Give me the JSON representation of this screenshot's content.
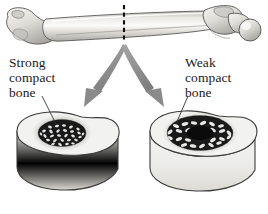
{
  "figure": {
    "background_color": "#ffffff"
  },
  "bone": {
    "name": "femur",
    "orientation": "horizontal",
    "fill_color": "#d8d6d0",
    "outline_color": "#4a4a4a",
    "section_marker": {
      "icon": "dashed-cut-line",
      "style": "dashed",
      "color": "#101010",
      "orientation": "vertical"
    }
  },
  "arrows": [
    {
      "id": "arrow-left",
      "direction": "down-left",
      "color": "#8e8e8e",
      "points_to": "strong-compact-bone-cross-section"
    },
    {
      "id": "arrow-right",
      "direction": "down-right",
      "color": "#8e8e8e",
      "points_to": "weak-compact-bone-cross-section"
    }
  ],
  "labels": {
    "strong": {
      "line1": "Strong",
      "line2": "compact",
      "line3": "bone",
      "full_text": "Strong compact bone",
      "color": "#1b1b1b"
    },
    "weak": {
      "line1": "Weak",
      "line2": "compact",
      "line3": "bone",
      "full_text": "Weak compact bone",
      "color": "#1b1b1b"
    }
  },
  "cross_sections": [
    {
      "id": "strong-compact-bone-cross-section",
      "label_ref": "strong",
      "top_face_color": "#f2f2f0",
      "side_wall_color": "#ebebe9",
      "outline_color": "#3c3c3c",
      "marrow_cavity": "absent",
      "spongy_bone_density": "dense",
      "spongy_bone_color": "#121212",
      "description": "Thick compact bone wall with dense trabecular core and no visible hollow cavity"
    },
    {
      "id": "weak-compact-bone-cross-section",
      "label_ref": "weak",
      "top_face_color": "#f2f2f0",
      "side_wall_color": "#ebebe9",
      "outline_color": "#3c3c3c",
      "marrow_cavity": "large",
      "spongy_bone_density": "sparse",
      "spongy_bone_color": "#121212",
      "description": "Thin compact bone wall with sparse trabeculae and a large dark hollow marrow cavity"
    }
  ],
  "colors": {
    "arrow_gray": "#8e8e8e",
    "bone_light": "#f2f2f0",
    "bone_shadow": "#c8c6c0",
    "outline": "#3c3c3c",
    "text": "#1b1b1b"
  }
}
